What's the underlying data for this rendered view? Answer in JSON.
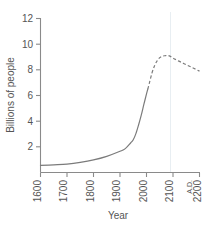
{
  "chart_data": {
    "type": "line",
    "title": "",
    "xlabel": "Year",
    "ylabel": "Billions of people",
    "xlim": [
      1600,
      2200
    ],
    "ylim": [
      0,
      12
    ],
    "xticks": [
      1600,
      1700,
      1800,
      1900,
      2000,
      2100,
      2200
    ],
    "xticklabels": [
      "1600",
      "1700",
      "1800",
      "1900",
      "2000",
      "2100",
      "2200"
    ],
    "yticks": [
      2,
      4,
      6,
      8,
      10,
      12
    ],
    "yticklabels": [
      "2",
      "4",
      "6",
      "8",
      "10",
      "12"
    ],
    "era_label": "A.D.",
    "grid": false,
    "legend": false,
    "series": [
      {
        "name": "Historical world population",
        "style": "solid",
        "x": [
          1600,
          1650,
          1700,
          1750,
          1800,
          1850,
          1900,
          1920,
          1940,
          1950,
          1960,
          1970,
          1980,
          1990,
          2000,
          2005
        ],
        "values": [
          0.55,
          0.6,
          0.66,
          0.79,
          0.98,
          1.26,
          1.65,
          1.86,
          2.3,
          2.55,
          3.03,
          3.7,
          4.45,
          5.3,
          6.12,
          6.5
        ]
      },
      {
        "name": "Projected world population",
        "style": "dashed",
        "x": [
          2005,
          2010,
          2020,
          2030,
          2040,
          2050,
          2060,
          2070,
          2080,
          2090,
          2100,
          2120,
          2140,
          2160,
          2180,
          2200
        ],
        "values": [
          6.5,
          6.9,
          7.7,
          8.3,
          8.7,
          8.95,
          9.06,
          9.1,
          9.12,
          9.05,
          8.92,
          8.7,
          8.5,
          8.3,
          8.1,
          7.9
        ]
      }
    ],
    "annotations": {
      "solid_to_dashed_transition_year": 2005,
      "peak_value": 9.12,
      "peak_year": 2080,
      "end_value": 7.9,
      "start_value": 0.55
    },
    "colors": {
      "line": "#7b7b7b",
      "axis": "#8a8a8a",
      "text": "#555555",
      "background": "#ffffff"
    }
  }
}
